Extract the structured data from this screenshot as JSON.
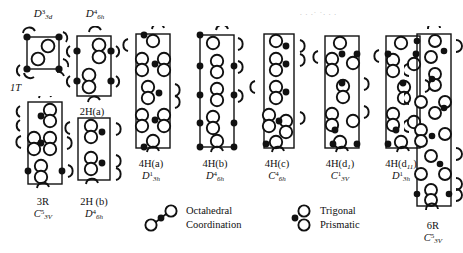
{
  "figure": {
    "background_color": "#ffffff",
    "ink_color": "#111111",
    "width": 463,
    "height": 253
  },
  "structures": [
    {
      "id": "1T",
      "top_label": "D",
      "top_sub": "3d",
      "top_sup": "3",
      "name": "1T",
      "name_italic_part": "T",
      "sym": "",
      "sym_sub": "",
      "sym_sup": "",
      "layers": 1,
      "coordination": "octahedral"
    },
    {
      "id": "2H(a)",
      "top_label": "D",
      "top_sub": "6h",
      "top_sup": "4",
      "name": "2H(a)",
      "sym": "",
      "sym_sub": "",
      "sym_sup": "",
      "layers": 2,
      "coordination": "trigonal-prismatic"
    },
    {
      "id": "3R",
      "top_label": "",
      "top_sub": "",
      "top_sup": "",
      "name": "3R",
      "sym": "C",
      "sym_sub": "3V",
      "sym_sup": "5",
      "layers": 3,
      "coordination": "trigonal-prismatic"
    },
    {
      "id": "2H(b)",
      "top_label": "",
      "top_sub": "",
      "top_sup": "",
      "name": "2H (b)",
      "sym": "D",
      "sym_sub": "6h",
      "sym_sup": "4",
      "layers": 2,
      "coordination": "trigonal-prismatic"
    },
    {
      "id": "4H(a)",
      "top_label": "",
      "top_sub": "",
      "top_sup": "",
      "name": "4H(a)",
      "sym": "D",
      "sym_sub": "3h",
      "sym_sup": "1",
      "layers": 4,
      "coordination": "mixed"
    },
    {
      "id": "4H(b)",
      "top_label": "",
      "top_sub": "",
      "top_sup": "",
      "name": "4H(b)",
      "sym": "D",
      "sym_sub": "6h",
      "sym_sup": "4",
      "layers": 4,
      "coordination": "mixed"
    },
    {
      "id": "4H(c)",
      "top_label": "",
      "top_sub": "",
      "top_sup": "",
      "name": "4H(c)",
      "sym": "C",
      "sym_sub": "6h",
      "sym_sup": "4",
      "layers": 4,
      "coordination": "mixed"
    },
    {
      "id": "4H(d1)",
      "top_label": "",
      "top_sub": "",
      "top_sup": "",
      "name": "4H(d",
      "name_sub": "1",
      "name_tail": ")",
      "sym": "C",
      "sym_sub": "3V",
      "sym_sup": "1",
      "layers": 4,
      "coordination": "mixed"
    },
    {
      "id": "4H(d11)",
      "top_label": "",
      "top_sub": "",
      "top_sup": "",
      "name": "4H(d",
      "name_sub": "11",
      "name_tail": ")",
      "sym": "D",
      "sym_sub": "3h",
      "sym_sup": "1",
      "layers": 4,
      "coordination": "mixed"
    },
    {
      "id": "6R",
      "top_label": "",
      "top_sub": "",
      "top_sup": "",
      "name": "6R",
      "sym": "C",
      "sym_sub": "3V",
      "sym_sup": "5",
      "layers": 6,
      "coordination": "mixed"
    }
  ],
  "legend": [
    {
      "id": "octahedral",
      "icon": "octahedral-coordination-icon",
      "line1": "Octahedral",
      "line2": "Coordination",
      "arrangement": "diagonal"
    },
    {
      "id": "trigonal-prismatic",
      "icon": "trigonal-prismatic-icon",
      "line1": "Trigonal",
      "line2": "Prismatic",
      "arrangement": "vertical"
    }
  ],
  "artifacts": {
    "scan_noise_top_right": ". .  .·  ·. . ."
  }
}
